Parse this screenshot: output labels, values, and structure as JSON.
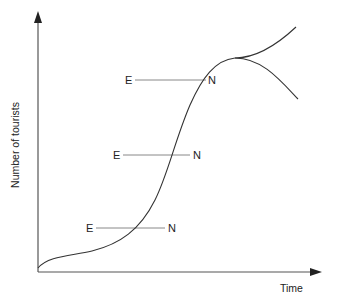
{
  "diagram": {
    "title": "",
    "axes": {
      "x_label": "Time",
      "y_label": "Number of tourists"
    },
    "curve": {
      "description": "S-shaped growth curve that plateaus then diverges into two branches (rise and decline)",
      "branches": [
        "rejuvenation (upward)",
        "decline (downward)"
      ]
    },
    "markers": [
      {
        "left": "E",
        "right": "N",
        "position": "upper"
      },
      {
        "left": "E",
        "right": "N",
        "position": "middle"
      },
      {
        "left": "E",
        "right": "N",
        "position": "lower"
      }
    ],
    "colors": {
      "axis": "#555555",
      "curve": "#333333",
      "marker_line": "#888888",
      "text": "#222222"
    }
  }
}
